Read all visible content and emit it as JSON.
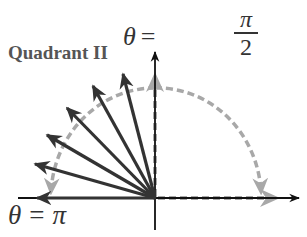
{
  "labels": {
    "quadrant": "Quadrant II",
    "top_theta": "θ",
    "top_equals": "=",
    "top_numerator": "π",
    "top_denominator": "2",
    "bottom_theta": "θ",
    "bottom_equals": "=",
    "bottom_value": "π"
  },
  "geometry": {
    "origin": [
      155,
      198
    ],
    "axis_color": "#111111",
    "ray_color": "#333333",
    "dashed_color": "#a8a8a8",
    "rays": [
      {
        "angle_label": "toward π",
        "tip": [
          37,
          198
        ]
      },
      {
        "tip": [
          35,
          164
        ]
      },
      {
        "tip": [
          47,
          135
        ]
      },
      {
        "tip": [
          67,
          108
        ]
      },
      {
        "tip": [
          93,
          86
        ]
      },
      {
        "tip": [
          123,
          74
        ]
      }
    ],
    "arc_radius": [
      104,
      110
    ]
  },
  "meaning": {
    "description": "Rays sweeping from θ = π/2 to θ = π through Quadrant II, with dashed gray arcs indicating angular sweep direction"
  }
}
